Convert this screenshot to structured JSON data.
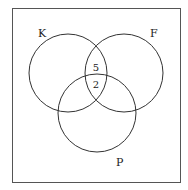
{
  "diagram": {
    "type": "venn",
    "sets": [
      {
        "label": "K",
        "cx": 68,
        "cy": 73,
        "r": 39,
        "label_x": 38,
        "label_y": 37
      },
      {
        "label": "F",
        "cx": 124,
        "cy": 73,
        "r": 39,
        "label_x": 150,
        "label_y": 37
      },
      {
        "label": "P",
        "cx": 97,
        "cy": 113,
        "r": 39,
        "label_x": 116,
        "label_y": 166
      }
    ],
    "regions": [
      {
        "sets": [
          "K",
          "F"
        ],
        "value": "5",
        "x": 96,
        "y": 71
      },
      {
        "sets": [
          "K",
          "F",
          "P"
        ],
        "value": "2",
        "x": 96,
        "y": 88
      }
    ],
    "colors": {
      "stroke": "#333333",
      "border": "#555555",
      "background": "#ffffff"
    }
  }
}
